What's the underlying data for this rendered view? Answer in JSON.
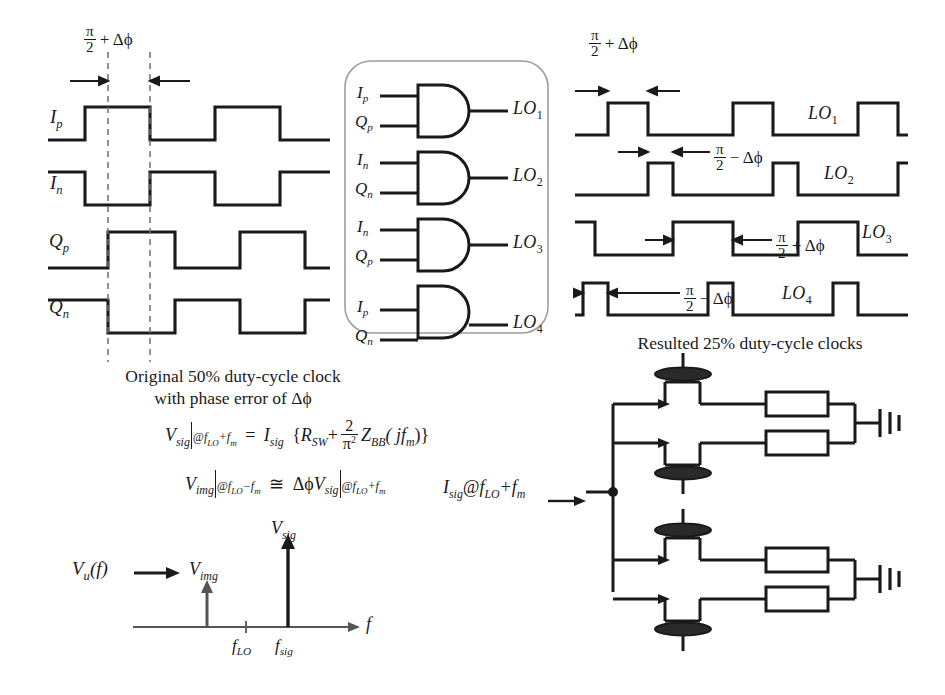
{
  "meta": {
    "figure_type": "circuit-and-timing-diagram",
    "line_color": "#1a1a1a",
    "dashed_color": "#6b6b6b",
    "box_outline_color": "#9a9a9a",
    "background": "#ffffff"
  },
  "left_waveforms": {
    "phase_annotation": {
      "num": "π",
      "den": "2",
      "op": "+",
      "delta": "Δϕ"
    },
    "signals": [
      {
        "name_base": "I",
        "name_sub": "p",
        "label": "Ip"
      },
      {
        "name_base": "I",
        "name_sub": "n",
        "label": "In"
      },
      {
        "name_base": "Q",
        "name_sub": "p",
        "label": "Qp"
      },
      {
        "name_base": "Q",
        "name_sub": "n",
        "label": "Qn"
      }
    ],
    "caption_line1": "Original 50% duty-cycle clock",
    "caption_line2": "with phase error of Δϕ"
  },
  "gate_block": {
    "gate_type": "AND",
    "gates": [
      {
        "in1_base": "I",
        "in1_sub": "p",
        "in2_base": "Q",
        "in2_sub": "p",
        "out_base": "LO",
        "out_sub": "1"
      },
      {
        "in1_base": "I",
        "in1_sub": "n",
        "in2_base": "Q",
        "in2_sub": "n",
        "out_base": "LO",
        "out_sub": "2"
      },
      {
        "in1_base": "I",
        "in1_sub": "n",
        "in2_base": "Q",
        "in2_sub": "p",
        "out_base": "LO",
        "out_sub": "3"
      },
      {
        "in1_base": "I",
        "in1_sub": "p",
        "in2_base": "Q",
        "in2_sub": "n",
        "out_base": "LO",
        "out_sub": "4"
      }
    ]
  },
  "right_waveforms": {
    "top_annotation": {
      "num": "π",
      "den": "2",
      "op": "+",
      "delta": "Δϕ"
    },
    "signals": [
      {
        "base": "LO",
        "sub": "1",
        "annotation_op": "+",
        "annotation_num": "π",
        "annotation_den": "2",
        "annotation_delta": "Δϕ"
      },
      {
        "base": "LO",
        "sub": "2",
        "annotation_op": "−",
        "annotation_num": "π",
        "annotation_den": "2",
        "annotation_delta": "Δϕ"
      },
      {
        "base": "LO",
        "sub": "3",
        "annotation_op": "+",
        "annotation_num": "π",
        "annotation_den": "2",
        "annotation_delta": "Δϕ"
      },
      {
        "base": "LO",
        "sub": "4",
        "annotation_op": "−",
        "annotation_num": "π",
        "annotation_den": "2",
        "annotation_delta": "Δϕ"
      }
    ],
    "caption": "Resulted 25% duty-cycle clocks"
  },
  "equations": {
    "eq1": {
      "lhs_base": "V",
      "lhs_sub": "sig",
      "cond1": "@f",
      "cond1_sub": "LO",
      "cond1_op": "+f",
      "cond1_sub2": "m",
      "rel": "=",
      "rhs_i": "I",
      "rhs_i_sub": "sig",
      "open": "{",
      "r": "R",
      "r_sub": "SW",
      "plus": "+",
      "frac_num": "2",
      "frac_den": "π",
      "frac_den_exp": "2",
      "z": "Z",
      "z_sub": "BB",
      "z_arg": "( jf",
      "z_arg_sub": "m",
      "close": ")}"
    },
    "eq2": {
      "lhs_base": "V",
      "lhs_sub": "img",
      "cond1": "@f",
      "cond1_sub": "LO",
      "cond1_op": "−f",
      "cond1_sub2": "m",
      "rel": "≅",
      "delta": "Δϕ",
      "rhs_base": "V",
      "rhs_sub": "sig",
      "cond2": "@f",
      "cond2_sub": "LO",
      "cond2_op": "+f",
      "cond2_sub2": "m"
    }
  },
  "spectrum_plot": {
    "type": "spectrum",
    "x_axis_label": "f",
    "input_label_base": "V",
    "input_label_sub": "u",
    "input_label_arg": "(f)",
    "tones": [
      {
        "label_base": "V",
        "label_sub": "img",
        "x_frac": 0.38,
        "height_frac": 0.3,
        "tick": false
      },
      {
        "label_base": "V",
        "label_sub": "sig",
        "x_frac": 0.72,
        "height_frac": 1.0,
        "tick": false
      }
    ],
    "x_ticks": [
      {
        "label_base": "f",
        "label_sub": "LO",
        "x_frac": 0.575
      },
      {
        "label_base": "f",
        "label_sub": "sig",
        "x_frac": 0.72
      }
    ]
  },
  "mixer_circuit": {
    "input_label_base": "I",
    "input_label_sub": "sig",
    "input_label_at": "@f",
    "input_label_at_sub": "LO",
    "input_label_op": "+f",
    "input_label_op_sub": "m",
    "switch_count": 4,
    "resistor_count": 4,
    "ground_count": 2,
    "element_names": [
      "switch",
      "resistor",
      "ground",
      "node-dot"
    ]
  }
}
